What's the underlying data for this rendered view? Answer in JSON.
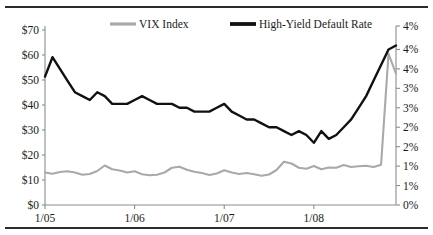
{
  "chart_data": {
    "type": "line",
    "title": "",
    "xlabel": "",
    "ylabel": "",
    "grid": false,
    "legend_position": "top-center",
    "x_tick_labels": [
      "1/05",
      "1/06",
      "1/07",
      "1/08"
    ],
    "x_tick_months": [
      0,
      12,
      24,
      36
    ],
    "x_range_months": [
      0,
      47
    ],
    "left_axis": {
      "label": "VIX Index (US$)",
      "tick_labels": [
        "$0",
        "$10",
        "$20",
        "$30",
        "$40",
        "$50",
        "$60",
        "$70"
      ],
      "tick_values": [
        0,
        10,
        20,
        30,
        40,
        50,
        60,
        70
      ],
      "ylim": [
        0,
        70
      ]
    },
    "right_axis": {
      "label": "High-Yield Default Rate (%)",
      "tick_labels": [
        "0%",
        "1%",
        "1%",
        "2%",
        "2%",
        "3%",
        "3%",
        "4%",
        "4%"
      ],
      "tick_values": [
        0,
        0.5,
        1.0,
        1.5,
        2.0,
        2.5,
        3.0,
        3.5,
        4.0
      ],
      "ylim": [
        0,
        4.5
      ]
    },
    "series": [
      {
        "name": "VIX Index",
        "axis": "left",
        "color": "#a9a9a9",
        "values": [
          13.0,
          12.5,
          13.2,
          13.5,
          13.0,
          12.1,
          12.4,
          13.6,
          15.8,
          14.3,
          13.8,
          13.0,
          13.5,
          12.3,
          11.9,
          12.1,
          13.0,
          14.9,
          15.3,
          14.1,
          13.3,
          12.8,
          12.0,
          12.6,
          13.9,
          13.0,
          12.4,
          12.8,
          12.3,
          11.7,
          12.2,
          14.0,
          17.3,
          16.6,
          14.9,
          14.5,
          15.6,
          14.3,
          15.0,
          14.9,
          16.0,
          15.2,
          15.5,
          15.7,
          15.2,
          16.1,
          60.5,
          52.5
        ]
      },
      {
        "name": "High-Yield Default Rate",
        "axis": "right",
        "color": "#111111",
        "values": [
          3.3,
          3.8,
          3.5,
          3.2,
          2.9,
          2.8,
          2.7,
          2.9,
          2.8,
          2.6,
          2.6,
          2.6,
          2.7,
          2.8,
          2.7,
          2.6,
          2.6,
          2.6,
          2.5,
          2.5,
          2.4,
          2.4,
          2.4,
          2.5,
          2.6,
          2.4,
          2.3,
          2.2,
          2.2,
          2.1,
          2.0,
          2.0,
          1.9,
          1.8,
          1.9,
          1.8,
          1.6,
          1.9,
          1.7,
          1.8,
          2.0,
          2.2,
          2.5,
          2.8,
          3.2,
          3.6,
          4.0,
          4.1
        ]
      }
    ]
  },
  "legend": {
    "items": [
      {
        "label": "VIX Index",
        "color": "#a9a9a9"
      },
      {
        "label": "High-Yield Default Rate",
        "color": "#111111"
      }
    ]
  }
}
